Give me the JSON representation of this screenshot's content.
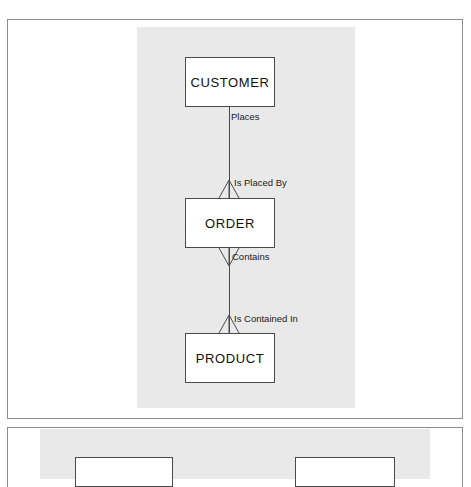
{
  "document": {
    "kind": "scanned-textbook-page",
    "background_color": "#ffffff",
    "frame_border_color": "#8d8d8d",
    "figure_plate_color": "#e9e9e9"
  },
  "figure_1": {
    "name": "entity-relationship-diagram",
    "notation": "crow's foot",
    "entities": [
      {
        "id": "customer",
        "label": "CUSTOMER"
      },
      {
        "id": "order",
        "label": "ORDER"
      },
      {
        "id": "product",
        "label": "PRODUCT"
      }
    ],
    "relationships": [
      {
        "id": "customer-order",
        "from": "CUSTOMER",
        "to": "ORDER",
        "forward_label": "Places",
        "reverse_label": "Is Placed By",
        "crowfoot_at": "ORDER",
        "crowfoot_direction": "up"
      },
      {
        "id": "order-product",
        "from": "ORDER",
        "to": "PRODUCT",
        "forward_label": "Contains",
        "reverse_label": "Is Contained In",
        "crowfoot_at_from": "ORDER",
        "crowfoot_at_to": "PRODUCT",
        "crowfoot_direction": "down-and-up"
      }
    ],
    "labels": {
      "places": "Places",
      "is_placed_by": "Is Placed By",
      "contains": "Contains",
      "is_contained_in": "Is Contained In"
    },
    "box_fill": "#ffffff",
    "box_border": "#4a4a4a",
    "line_color": "#4a4a4a"
  },
  "figure_2": {
    "name": "partial-diagram-below-fold",
    "note_visible_text": "",
    "entities": [
      {
        "id": "partial-left",
        "label": ""
      },
      {
        "id": "partial-right",
        "label": ""
      }
    ]
  }
}
